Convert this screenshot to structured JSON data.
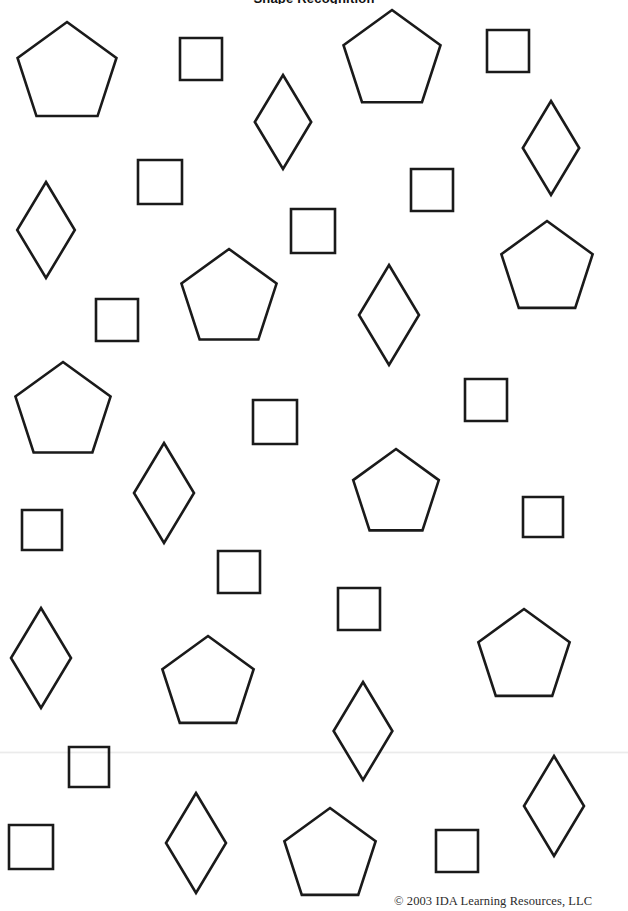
{
  "page": {
    "width": 628,
    "height": 911,
    "background_color": "#ffffff",
    "stroke_color": "#1a1a1a",
    "stroke_width": 2.6,
    "header_text": "Shape Recognition",
    "copyright": "© 2003 IDA Learning Resources, LLC"
  },
  "chart_data": {
    "type": "scatter",
    "title": "Shape Recognition",
    "xlabel": "",
    "ylabel": "",
    "xlim": [
      0,
      628
    ],
    "ylim": [
      0,
      911
    ],
    "grid": false,
    "legend": "none",
    "categories": [
      "pentagon",
      "square",
      "rhombus"
    ],
    "values": [
      11,
      16,
      10
    ],
    "series": [
      {
        "name": "pentagon",
        "count": 11,
        "marks": [
          {
            "cx": 67,
            "cy": 74,
            "size": 52,
            "rot": 0
          },
          {
            "cx": 392,
            "cy": 61,
            "size": 51,
            "rot": 0
          },
          {
            "cx": 229,
            "cy": 299,
            "size": 50,
            "rot": 0
          },
          {
            "cx": 547,
            "cy": 269,
            "size": 48,
            "rot": 0
          },
          {
            "cx": 63,
            "cy": 412,
            "size": 50,
            "rot": 0
          },
          {
            "cx": 396,
            "cy": 494,
            "size": 45,
            "rot": 0
          },
          {
            "cx": 208,
            "cy": 684,
            "size": 48,
            "rot": 0
          },
          {
            "cx": 524,
            "cy": 657,
            "size": 48,
            "rot": 0
          },
          {
            "cx": 330,
            "cy": 856,
            "size": 48,
            "rot": 0
          }
        ]
      },
      {
        "name": "square",
        "count": 16,
        "marks": [
          {
            "cx": 201,
            "cy": 59,
            "size": 41,
            "rot": 0
          },
          {
            "cx": 508,
            "cy": 51,
            "size": 41,
            "rot": 0
          },
          {
            "cx": 160,
            "cy": 182,
            "size": 44,
            "rot": 0
          },
          {
            "cx": 432,
            "cy": 190,
            "size": 42,
            "rot": 0
          },
          {
            "cx": 313,
            "cy": 231,
            "size": 44,
            "rot": 0
          },
          {
            "cx": 117,
            "cy": 320,
            "size": 42,
            "rot": 0
          },
          {
            "cx": 486,
            "cy": 400,
            "size": 42,
            "rot": 0
          },
          {
            "cx": 275,
            "cy": 422,
            "size": 44,
            "rot": 0
          },
          {
            "cx": 42,
            "cy": 530,
            "size": 40,
            "rot": 0
          },
          {
            "cx": 543,
            "cy": 517,
            "size": 40,
            "rot": 0
          },
          {
            "cx": 239,
            "cy": 572,
            "size": 42,
            "rot": 0
          },
          {
            "cx": 359,
            "cy": 609,
            "size": 42,
            "rot": 0
          },
          {
            "cx": 89,
            "cy": 767,
            "size": 40,
            "rot": 0
          },
          {
            "cx": 31,
            "cy": 847,
            "size": 44,
            "rot": 0
          },
          {
            "cx": 457,
            "cy": 851,
            "size": 42,
            "rot": 0
          }
        ]
      },
      {
        "name": "rhombus",
        "count": 10,
        "marks": [
          {
            "cx": 283,
            "cy": 122,
            "size": 47,
            "rot": 0
          },
          {
            "cx": 551,
            "cy": 148,
            "size": 47,
            "rot": 0
          },
          {
            "cx": 46,
            "cy": 230,
            "size": 48,
            "rot": 0
          },
          {
            "cx": 389,
            "cy": 315,
            "size": 50,
            "rot": 0
          },
          {
            "cx": 164,
            "cy": 493,
            "size": 50,
            "rot": 0
          },
          {
            "cx": 41,
            "cy": 658,
            "size": 50,
            "rot": 0
          },
          {
            "cx": 363,
            "cy": 731,
            "size": 49,
            "rot": 0
          },
          {
            "cx": 554,
            "cy": 806,
            "size": 50,
            "rot": 0
          },
          {
            "cx": 196,
            "cy": 843,
            "size": 50,
            "rot": 0
          }
        ]
      }
    ]
  },
  "shapes": [
    {
      "kind": "pentagon",
      "cx": 67,
      "cy": 74,
      "r": 52,
      "rot": 0
    },
    {
      "kind": "square",
      "cx": 201,
      "cy": 59,
      "r": 21,
      "rot": 0
    },
    {
      "kind": "pentagon",
      "cx": 392,
      "cy": 61,
      "r": 51,
      "rot": 0
    },
    {
      "kind": "square",
      "cx": 508,
      "cy": 51,
      "r": 21,
      "rot": 0
    },
    {
      "kind": "rhombus",
      "cx": 283,
      "cy": 122,
      "r": 47,
      "rot": 0
    },
    {
      "kind": "rhombus",
      "cx": 551,
      "cy": 148,
      "r": 47,
      "rot": 0
    },
    {
      "kind": "square",
      "cx": 160,
      "cy": 182,
      "r": 22,
      "rot": 0
    },
    {
      "kind": "square",
      "cx": 432,
      "cy": 190,
      "r": 21,
      "rot": 0
    },
    {
      "kind": "rhombus",
      "cx": 46,
      "cy": 230,
      "r": 48,
      "rot": 0
    },
    {
      "kind": "square",
      "cx": 313,
      "cy": 231,
      "r": 22,
      "rot": 0
    },
    {
      "kind": "pentagon",
      "cx": 547,
      "cy": 269,
      "r": 48,
      "rot": 0
    },
    {
      "kind": "pentagon",
      "cx": 229,
      "cy": 299,
      "r": 50,
      "rot": 0
    },
    {
      "kind": "rhombus",
      "cx": 389,
      "cy": 315,
      "r": 50,
      "rot": 0
    },
    {
      "kind": "square",
      "cx": 117,
      "cy": 320,
      "r": 21,
      "rot": 0
    },
    {
      "kind": "square",
      "cx": 486,
      "cy": 400,
      "r": 21,
      "rot": 0
    },
    {
      "kind": "pentagon",
      "cx": 63,
      "cy": 412,
      "r": 50,
      "rot": 0
    },
    {
      "kind": "square",
      "cx": 275,
      "cy": 422,
      "r": 22,
      "rot": 0
    },
    {
      "kind": "rhombus",
      "cx": 164,
      "cy": 493,
      "r": 50,
      "rot": 0
    },
    {
      "kind": "pentagon",
      "cx": 396,
      "cy": 494,
      "r": 45,
      "rot": 0
    },
    {
      "kind": "square",
      "cx": 543,
      "cy": 517,
      "r": 20,
      "rot": 0
    },
    {
      "kind": "square",
      "cx": 42,
      "cy": 530,
      "r": 20,
      "rot": 0
    },
    {
      "kind": "square",
      "cx": 239,
      "cy": 572,
      "r": 21,
      "rot": 0
    },
    {
      "kind": "square",
      "cx": 359,
      "cy": 609,
      "r": 21,
      "rot": 0
    },
    {
      "kind": "rhombus",
      "cx": 41,
      "cy": 658,
      "r": 50,
      "rot": 0
    },
    {
      "kind": "pentagon",
      "cx": 524,
      "cy": 657,
      "r": 48,
      "rot": 0
    },
    {
      "kind": "pentagon",
      "cx": 208,
      "cy": 684,
      "r": 48,
      "rot": 0
    },
    {
      "kind": "rhombus",
      "cx": 363,
      "cy": 731,
      "r": 49,
      "rot": 0
    },
    {
      "kind": "square",
      "cx": 89,
      "cy": 767,
      "r": 20,
      "rot": 0
    },
    {
      "kind": "rhombus",
      "cx": 554,
      "cy": 806,
      "r": 50,
      "rot": 0
    },
    {
      "kind": "rhombus",
      "cx": 196,
      "cy": 843,
      "r": 50,
      "rot": 0
    },
    {
      "kind": "square",
      "cx": 31,
      "cy": 847,
      "r": 22,
      "rot": 0
    },
    {
      "kind": "pentagon",
      "cx": 330,
      "cy": 856,
      "r": 48,
      "rot": 0
    },
    {
      "kind": "square",
      "cx": 457,
      "cy": 851,
      "r": 21,
      "rot": 0
    }
  ]
}
